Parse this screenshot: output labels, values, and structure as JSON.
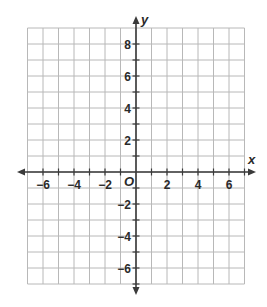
{
  "chart_data": {
    "type": "scatter",
    "title": "",
    "xlabel": "x",
    "ylabel": "y",
    "origin_label": "O",
    "xlim": [
      -7,
      7
    ],
    "ylim": [
      -7,
      9
    ],
    "grid": true,
    "grid_step": 1,
    "x_tick_labels": [
      "-6",
      "-4",
      "-2",
      "2",
      "4",
      "6"
    ],
    "x_tick_values": [
      -6,
      -4,
      -2,
      2,
      4,
      6
    ],
    "y_tick_labels": [
      "8",
      "6",
      "4",
      "2",
      "-2",
      "-4",
      "-6"
    ],
    "y_tick_values": [
      8,
      6,
      4,
      2,
      -2,
      -4,
      -6
    ],
    "series": [],
    "legend": null
  },
  "colors": {
    "grid": "#b8b8b8",
    "axis": "#3a3a3a",
    "text": "#2a2a2a"
  }
}
